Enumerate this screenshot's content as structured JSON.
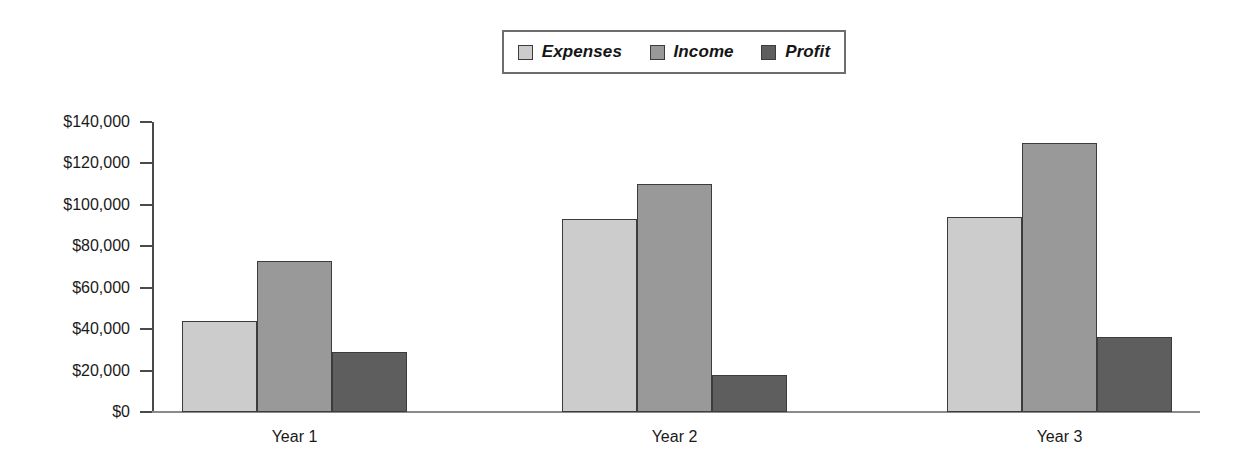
{
  "chart_data": {
    "type": "bar",
    "title": "",
    "subtitle": "",
    "xlabel": "",
    "ylabel": "",
    "categories": [
      "Year 1",
      "Year 2",
      "Year 3"
    ],
    "series": [
      {
        "name": "Expenses",
        "color": "#cccccc",
        "values": [
          44000,
          93000,
          94000
        ]
      },
      {
        "name": "Income",
        "color": "#999999",
        "values": [
          73000,
          110000,
          130000
        ]
      },
      {
        "name": "Profit",
        "color": "#5e5e5e",
        "values": [
          29000,
          18000,
          36000
        ]
      }
    ],
    "ylim": [
      0,
      140000
    ],
    "ytick_values": [
      0,
      20000,
      40000,
      60000,
      80000,
      100000,
      120000,
      140000
    ],
    "ytick_labels": [
      "$0",
      "$20,000",
      "$40,000",
      "$60,000",
      "$80,000",
      "$100,000",
      "$120,000",
      "$140,000"
    ],
    "grid": false,
    "legend_position": "top-center",
    "legend_entries": [
      "Expenses",
      "Income",
      "Profit"
    ],
    "bar_border_color": "#3c3c3c",
    "axis_color": "#4a4a4a"
  }
}
